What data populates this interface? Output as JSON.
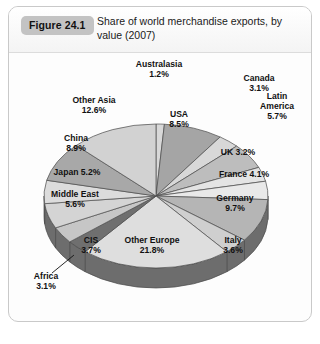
{
  "figure": {
    "badge": "Figure 24.1",
    "title": "Share of world merchandise exports, by value (2007)"
  },
  "chart_data": {
    "type": "pie",
    "title": "Share of world merchandise exports, by value (2007)",
    "unit": "%",
    "legend": "none",
    "labels_inside_and_outside": true,
    "categories": [
      "Australasia",
      "USA",
      "Canada",
      "Latin America",
      "UK",
      "France",
      "Germany",
      "Italy",
      "Other Europe",
      "Africa",
      "CIS",
      "Middle East",
      "Japan",
      "China",
      "Other Asia"
    ],
    "values": [
      1.2,
      8.5,
      3.1,
      5.7,
      3.2,
      4.1,
      9.7,
      3.6,
      21.8,
      3.1,
      3.7,
      5.6,
      5.2,
      8.9,
      12.6
    ],
    "slices": [
      {
        "name": "Australasia",
        "value": 1.2,
        "label": "Australasia",
        "percent": "1.2%",
        "fill": "#d8d8d8",
        "label_position": "outside-top"
      },
      {
        "name": "USA",
        "value": 8.5,
        "label": "USA",
        "percent": "8.5%",
        "fill": "#a5a5a5",
        "label_position": "inside"
      },
      {
        "name": "Canada",
        "value": 3.1,
        "label": "Canada",
        "percent": "3.1%",
        "fill": "#d8d8d8",
        "label_position": "outside-right"
      },
      {
        "name": "Latin America",
        "value": 5.7,
        "label": "Latin America",
        "percent": "5.7%",
        "fill": "#bdbdbd",
        "label_position": "outside-right"
      },
      {
        "name": "UK",
        "value": 3.2,
        "label": "UK",
        "percent": "3.2%",
        "fill": "#e4e4e4",
        "label_position": "inside"
      },
      {
        "name": "France",
        "value": 4.1,
        "label": "France",
        "percent": "4.1%",
        "fill": "#e9e9e9",
        "label_position": "inside"
      },
      {
        "name": "Germany",
        "value": 9.7,
        "label": "Germany",
        "percent": "9.7%",
        "fill": "#b5b5b5",
        "label_position": "inside"
      },
      {
        "name": "Italy",
        "value": 3.6,
        "label": "Italy",
        "percent": "3.6%",
        "fill": "#cfcfcf",
        "label_position": "inside"
      },
      {
        "name": "Other Europe",
        "value": 21.8,
        "label": "Other Europe",
        "percent": "21.8%",
        "fill": "#dedede",
        "label_position": "inside"
      },
      {
        "name": "Africa",
        "value": 3.1,
        "label": "Africa",
        "percent": "3.1%",
        "fill": "#6f6f6f",
        "label_position": "outside-left-leader"
      },
      {
        "name": "CIS",
        "value": 3.7,
        "label": "CIS",
        "percent": "3.7%",
        "fill": "#c6c6c6",
        "label_position": "inside"
      },
      {
        "name": "Middle East",
        "value": 5.6,
        "label": "Middle East",
        "percent": "5.6%",
        "fill": "#d4d4d4",
        "label_position": "inside"
      },
      {
        "name": "Japan",
        "value": 5.2,
        "label": "Japan",
        "percent": "5.2%",
        "fill": "#dcdcdc",
        "label_position": "inside"
      },
      {
        "name": "China",
        "value": 8.9,
        "label": "China",
        "percent": "8.9%",
        "fill": "#a8a8a8",
        "label_position": "inside"
      },
      {
        "name": "Other Asia",
        "value": 12.6,
        "label": "Other Asia",
        "percent": "12.6%",
        "fill": "#d2d2d2",
        "label_position": "inside"
      }
    ],
    "style": {
      "three_d": true,
      "side_wall_color": "#6d6d6d",
      "outline_color": "#4a4a4a",
      "background": "#fdfdfd"
    }
  }
}
